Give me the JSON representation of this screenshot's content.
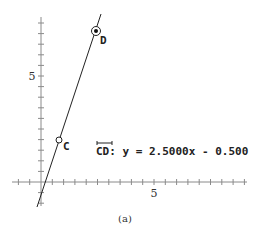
{
  "figure": {
    "caption": "(a)",
    "equation": {
      "line_name": "CD",
      "text": ": y = 2.5000x - 0.500"
    },
    "points": [
      {
        "name": "C",
        "label": "C",
        "style": "open-circle"
      },
      {
        "name": "D",
        "label": "D",
        "style": "bullseye"
      }
    ],
    "axes": {
      "x_tick_label": "5",
      "y_tick_label": "5"
    }
  },
  "chart_data": {
    "type": "line",
    "title": "",
    "xlabel": "",
    "ylabel": "",
    "x_tick_labels": [
      "5"
    ],
    "y_tick_labels": [
      "5"
    ],
    "tick_interval": 0.5,
    "xlim": [
      -1.3,
      9.0
    ],
    "ylim": [
      -1.1,
      7.8
    ],
    "grid": false,
    "series": [
      {
        "name": "CD",
        "equation": "y = 2.5000x - 0.500",
        "slope": 2.5,
        "intercept": -0.5
      }
    ],
    "points": [
      {
        "label": "C",
        "x": 1.0,
        "y": 2.0
      },
      {
        "label": "D",
        "x": 3.0,
        "y": 7.0
      }
    ],
    "annotations": [
      "CD: y = 2.5000x - 0.500",
      "(a)"
    ]
  }
}
